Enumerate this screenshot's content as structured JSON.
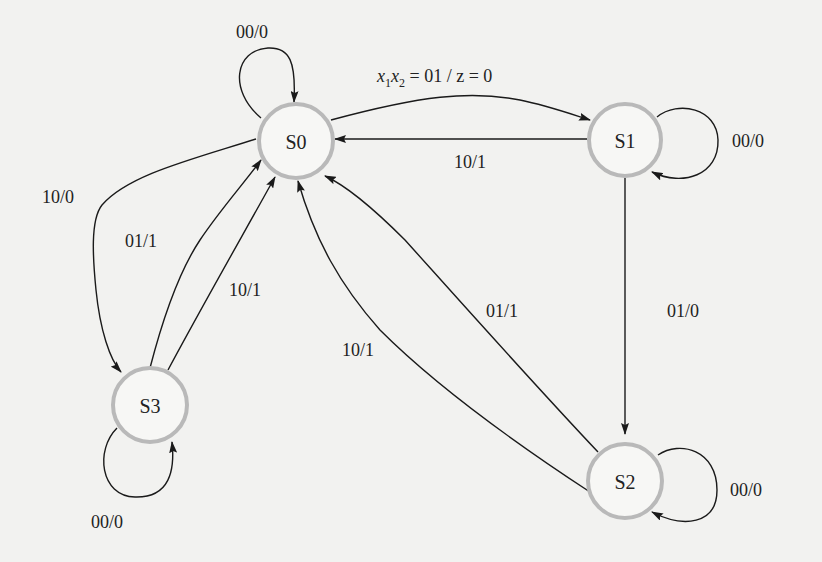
{
  "diagram": {
    "type": "finite-state-machine",
    "colors": {
      "node_stroke": "#b9b9b9",
      "edge": "#1a1a1a",
      "background": "#f2f2f0",
      "text": "#222222"
    },
    "nodes": [
      {
        "id": "S0",
        "label": "S0"
      },
      {
        "id": "S1",
        "label": "S1"
      },
      {
        "id": "S2",
        "label": "S2"
      },
      {
        "id": "S3",
        "label": "S3"
      }
    ],
    "edges": [
      {
        "from": "S0",
        "to": "S0",
        "label": "00/0"
      },
      {
        "from": "S0",
        "to": "S1",
        "label_prefix": "x",
        "sub1": "1",
        "mid": "x",
        "sub2": "2",
        "label_suffix": " = 01 / z = 0"
      },
      {
        "from": "S1",
        "to": "S0",
        "label": "10/1"
      },
      {
        "from": "S1",
        "to": "S1",
        "label": "00/0"
      },
      {
        "from": "S0",
        "to": "S3",
        "label": "10/0"
      },
      {
        "from": "S3",
        "to": "S0",
        "label": "01/1"
      },
      {
        "from": "S3",
        "to": "S0",
        "label": "10/1"
      },
      {
        "from": "S3",
        "to": "S3",
        "label": "00/0"
      },
      {
        "from": "S1",
        "to": "S2",
        "label": "01/0"
      },
      {
        "from": "S2",
        "to": "S0",
        "label": "01/1"
      },
      {
        "from": "S2",
        "to": "S0",
        "label": "10/1"
      },
      {
        "from": "S2",
        "to": "S2",
        "label": "00/0"
      }
    ]
  }
}
